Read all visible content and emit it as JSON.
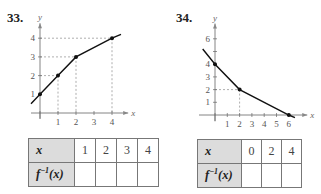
{
  "problems": [
    {
      "number": "33.",
      "table": {
        "row1_label": "x",
        "row2_label_base": "f",
        "row2_label_sup": "−1",
        "row2_label_arg": "(x)",
        "x_values": [
          "1",
          "2",
          "3",
          "4"
        ],
        "inverse_values": [
          "",
          "",
          "",
          ""
        ]
      }
    },
    {
      "number": "34.",
      "table": {
        "row1_label": "x",
        "row2_label_base": "f",
        "row2_label_sup": "−1",
        "row2_label_arg": "(x)",
        "x_values": [
          "0",
          "2",
          "4"
        ],
        "inverse_values": [
          "",
          "",
          ""
        ]
      }
    }
  ],
  "chart_data": [
    {
      "type": "line",
      "title": "33.",
      "xlabel": "x",
      "ylabel": "y",
      "x": [
        -0.5,
        0,
        1,
        2,
        4,
        4.5
      ],
      "y": [
        0.5,
        1,
        2,
        3,
        4,
        4.2
      ],
      "points": [
        [
          0,
          1
        ],
        [
          1,
          2
        ],
        [
          2,
          3
        ],
        [
          4,
          4
        ]
      ],
      "xticks": [
        1,
        2,
        3,
        4
      ],
      "yticks": [
        1,
        2,
        3,
        4
      ],
      "xlim": [
        -0.5,
        4.9
      ],
      "ylim": [
        -0.3,
        4.8
      ],
      "dashed_guides": true,
      "grid": false
    },
    {
      "type": "line",
      "title": "34.",
      "xlabel": "x",
      "ylabel": "y",
      "x": [
        -1,
        0,
        2,
        6,
        6.5
      ],
      "y": [
        5.2,
        4,
        2,
        0,
        -0.2
      ],
      "points": [
        [
          0,
          4
        ],
        [
          2,
          2
        ],
        [
          6,
          0
        ]
      ],
      "xticks": [
        1,
        2,
        3,
        4,
        5,
        6
      ],
      "yticks": [
        1,
        2,
        3,
        4,
        5,
        6
      ],
      "ytick_labels": [
        "1",
        "2",
        "3",
        "4",
        "",
        "6"
      ],
      "xlim": [
        -1.3,
        7.5
      ],
      "ylim": [
        -0.5,
        7.2
      ],
      "dashed_guides": true,
      "grid": false
    }
  ]
}
